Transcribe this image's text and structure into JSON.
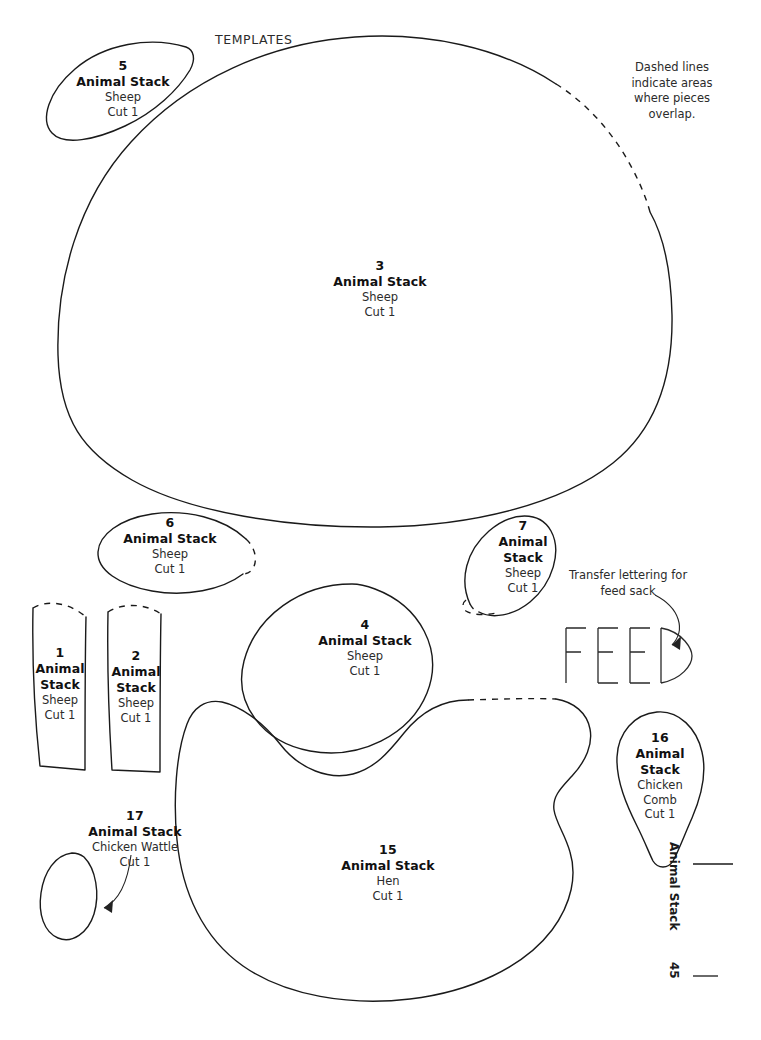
{
  "page": {
    "heading": "TEMPLATES",
    "footer_title": "Animal Stack",
    "footer_page": "45",
    "background_color": "#ffffff",
    "ink_color": "#1a1a1a"
  },
  "notes": {
    "overlap": "Dashed lines indicate areas where pieces overlap.",
    "transfer": "Transfer lettering for feed sack"
  },
  "feed_lettering": {
    "text": "FEED"
  },
  "common": {
    "title": "Animal Stack",
    "cut": "Cut 1"
  },
  "pieces": [
    {
      "number": "5",
      "title": "Animal Stack",
      "part": "Sheep",
      "cut": "Cut 1",
      "title_line1": "Animal Stack",
      "title_line2": ""
    },
    {
      "number": "3",
      "title": "Animal Stack",
      "part": "Sheep",
      "cut": "Cut 1",
      "title_line1": "Animal Stack",
      "title_line2": ""
    },
    {
      "number": "6",
      "title": "Animal Stack",
      "part": "Sheep",
      "cut": "Cut 1",
      "title_line1": "Animal Stack",
      "title_line2": ""
    },
    {
      "number": "7",
      "title": "Animal Stack",
      "part": "Sheep",
      "cut": "Cut 1",
      "title_line1": "Animal",
      "title_line2": "Stack"
    },
    {
      "number": "1",
      "title": "Animal Stack",
      "part": "Sheep",
      "cut": "Cut 1",
      "title_line1": "Animal",
      "title_line2": "Stack"
    },
    {
      "number": "2",
      "title": "Animal Stack",
      "part": "Sheep",
      "cut": "Cut 1",
      "title_line1": "Animal",
      "title_line2": "Stack"
    },
    {
      "number": "4",
      "title": "Animal Stack",
      "part": "Sheep",
      "cut": "Cut 1",
      "title_line1": "Animal Stack",
      "title_line2": ""
    },
    {
      "number": "15",
      "title": "Animal Stack",
      "part": "Hen",
      "cut": "Cut 1",
      "title_line1": "Animal Stack",
      "title_line2": ""
    },
    {
      "number": "16",
      "title": "Animal Stack",
      "part_line1": "Chicken",
      "part_line2": "Comb",
      "cut": "Cut 1",
      "title_line1": "Animal",
      "title_line2": "Stack"
    },
    {
      "number": "17",
      "title": "Animal Stack",
      "part": "Chicken Wattle",
      "cut": "Cut 1",
      "title_line1": "Animal Stack",
      "title_line2": ""
    }
  ]
}
